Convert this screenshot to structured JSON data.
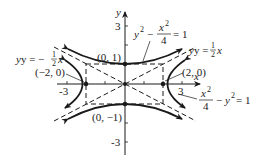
{
  "figure": {
    "type": "hyperbola-graph",
    "axes": {
      "x_label": "x",
      "y_label": "y",
      "x_ticks": [
        "-3",
        "3"
      ],
      "y_ticks": [
        "3",
        "-3"
      ]
    },
    "asymptotes": [
      {
        "label_prefix": "y = ",
        "label_frac_num": "1",
        "label_frac_den": "2",
        "label_suffix": "x",
        "equation": "y = 1/2 x"
      },
      {
        "label_prefix": "y = −",
        "label_frac_num": "1",
        "label_frac_den": "2",
        "label_suffix": "x",
        "equation": "y = -1/2 x"
      }
    ],
    "curves": [
      {
        "equation": "y^2 - x^2/4 = 1",
        "label_lhs_a": "y",
        "label_lhs_a_exp": "2",
        "label_minus": "−",
        "label_frac_num": "x",
        "label_frac_num_exp": "2",
        "label_frac_den": "4",
        "label_rhs": "= 1"
      },
      {
        "equation": "x^2/4 - y^2 = 1",
        "label_frac_num": "x",
        "label_frac_num_exp": "2",
        "label_frac_den": "4",
        "label_minus": "−",
        "label_b": "y",
        "label_b_exp": "2",
        "label_rhs": "= 1"
      }
    ],
    "points": [
      {
        "label": "(0, 1)",
        "x": 0,
        "y": 1
      },
      {
        "label": "(0, −1)",
        "x": 0,
        "y": -1
      },
      {
        "label": "(−2, 0)",
        "x": -2,
        "y": 0
      },
      {
        "label": "(2, 0)",
        "x": 2,
        "y": 0
      }
    ],
    "colors": {
      "ink": "#1a1a1a",
      "background": "#ffffff"
    }
  }
}
